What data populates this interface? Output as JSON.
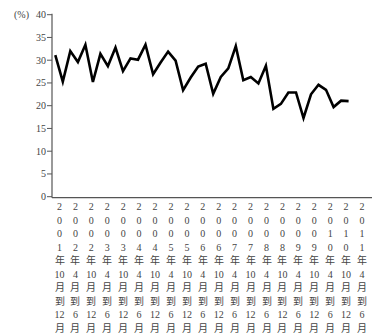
{
  "chart_data": {
    "type": "line",
    "title": "",
    "xlabel": "",
    "ylabel": "(%)",
    "ylim": [
      0,
      40
    ],
    "yticks": [
      0,
      5,
      10,
      15,
      20,
      25,
      30,
      35,
      40
    ],
    "grid": false,
    "legend": null,
    "x_tick_labels": [
      "2001年10月到12月",
      "2002年4月到6月",
      "2002年10月到12月",
      "2003年4月到6月",
      "2003年10月到12月",
      "2004年4月到6月",
      "2004年10月到12月",
      "2005年4月到6月",
      "2005年10月到12月",
      "2006年4月到6月",
      "2006年10月到12月",
      "2007年4月到6月",
      "2007年10月到12月",
      "2008年4月到6月",
      "2008年10月到12月",
      "2009年4月到6月",
      "2009年10月到12月",
      "2010年4月到6月",
      "2010年10月到12月",
      "2011年4月到6月"
    ],
    "x_tick_columns": [
      [
        "2",
        "0",
        "0",
        "1",
        "年",
        "10",
        "月",
        "到",
        "12",
        "月"
      ],
      [
        "2",
        "0",
        "0",
        "2",
        "年",
        "4",
        "月",
        "到",
        "6",
        "月"
      ],
      [
        "2",
        "0",
        "0",
        "2",
        "年",
        "10",
        "月",
        "到",
        "12",
        "月"
      ],
      [
        "2",
        "0",
        "0",
        "3",
        "年",
        "4",
        "月",
        "到",
        "6",
        "月"
      ],
      [
        "2",
        "0",
        "0",
        "3",
        "年",
        "10",
        "月",
        "到",
        "12",
        "月"
      ],
      [
        "2",
        "0",
        "0",
        "4",
        "年",
        "4",
        "月",
        "到",
        "6",
        "月"
      ],
      [
        "2",
        "0",
        "0",
        "4",
        "年",
        "10",
        "月",
        "到",
        "12",
        "月"
      ],
      [
        "2",
        "0",
        "0",
        "5",
        "年",
        "4",
        "月",
        "到",
        "6",
        "月"
      ],
      [
        "2",
        "0",
        "0",
        "5",
        "年",
        "10",
        "月",
        "到",
        "12",
        "月"
      ],
      [
        "2",
        "0",
        "0",
        "6",
        "年",
        "4",
        "月",
        "到",
        "6",
        "月"
      ],
      [
        "2",
        "0",
        "0",
        "6",
        "年",
        "10",
        "月",
        "到",
        "12",
        "月"
      ],
      [
        "2",
        "0",
        "0",
        "7",
        "年",
        "4",
        "月",
        "到",
        "6",
        "月"
      ],
      [
        "2",
        "0",
        "0",
        "7",
        "年",
        "10",
        "月",
        "到",
        "12",
        "月"
      ],
      [
        "2",
        "0",
        "0",
        "8",
        "年",
        "4",
        "月",
        "到",
        "6",
        "月"
      ],
      [
        "2",
        "0",
        "0",
        "8",
        "年",
        "10",
        "月",
        "到",
        "12",
        "月"
      ],
      [
        "2",
        "0",
        "0",
        "9",
        "年",
        "4",
        "月",
        "到",
        "6",
        "月"
      ],
      [
        "2",
        "0",
        "0",
        "9",
        "年",
        "10",
        "月",
        "到",
        "12",
        "月"
      ],
      [
        "2",
        "0",
        "1",
        "0",
        "年",
        "4",
        "月",
        "到",
        "6",
        "月"
      ],
      [
        "2",
        "0",
        "1",
        "0",
        "年",
        "10",
        "月",
        "到",
        "12",
        "月"
      ],
      [
        "2",
        "0",
        "1",
        "1",
        "年",
        "4",
        "月",
        "到",
        "6",
        "月"
      ]
    ],
    "series": [
      {
        "name": "rate",
        "color": "#000000",
        "values": [
          31.1,
          25.3,
          32.0,
          29.6,
          33.4,
          25.2,
          31.4,
          28.7,
          32.8,
          27.6,
          30.4,
          30.1,
          33.4,
          26.9,
          29.5,
          31.9,
          29.9,
          23.4,
          26.2,
          28.6,
          29.2,
          22.6,
          26.3,
          28.2,
          33.1,
          25.6,
          26.3,
          24.9,
          28.8,
          19.3,
          20.4,
          22.9,
          22.9,
          17.3,
          22.5,
          24.6,
          23.5,
          19.7,
          21.1,
          21.0
        ]
      }
    ]
  }
}
